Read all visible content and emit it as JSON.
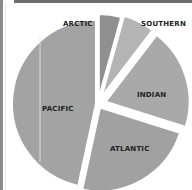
{
  "chart_data": {
    "type": "pie",
    "title": "",
    "categories": [
      "ARCTIC",
      "SOUTHERN",
      "INDIAN",
      "ATLANTIC",
      "PACIFIC"
    ],
    "values": [
      4.3,
      6.1,
      19.5,
      23.5,
      46.6
    ],
    "unit": "percent of world ocean area (estimated)",
    "start_angle_deg": 0,
    "direction": "clockwise",
    "exploded": true,
    "colors": [
      "#8f8f8f",
      "#b4b4b4",
      "#a9a9a9",
      "#a1a1a1",
      "#a3a3a3"
    ],
    "legend": "none (direct labels)"
  },
  "labels": {
    "arctic": "ARCTIC",
    "southern": "SOUTHERN",
    "indian": "INDIAN",
    "atlantic": "ATLANTIC",
    "pacific": "PACIFIC"
  }
}
